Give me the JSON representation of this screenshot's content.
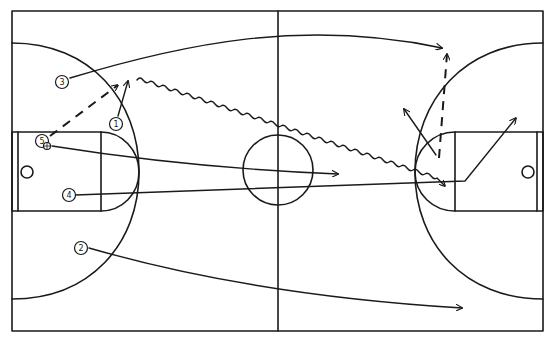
{
  "diagram": {
    "type": "basketball-play-diagram",
    "colors": {
      "line": "#1a1a1a",
      "background": "#ffffff"
    },
    "players": [
      {
        "id": "1",
        "label": "1",
        "x": 116,
        "y": 124
      },
      {
        "id": "2",
        "label": "2",
        "x": 81,
        "y": 248
      },
      {
        "id": "3",
        "label": "3",
        "x": 62,
        "y": 82
      },
      {
        "id": "4",
        "label": "4",
        "x": 69,
        "y": 195
      },
      {
        "id": "5",
        "label": "5",
        "x": 42,
        "y": 141
      }
    ],
    "ball": {
      "holder": "5",
      "x": 47,
      "y": 145
    },
    "actions": [
      {
        "id": "cut-3",
        "kind": "cut",
        "from": "3",
        "description": "Player 3 cuts across court to right wing"
      },
      {
        "id": "cut-1",
        "kind": "cut",
        "from": "1",
        "description": "Player 1 short cut up"
      },
      {
        "id": "pass-5-1",
        "kind": "pass",
        "from": "5",
        "to": "1",
        "description": "Dashed pass from 5 toward 1"
      },
      {
        "id": "dribble-1",
        "kind": "dribble",
        "from": "1",
        "description": "Player 1 dribbles to right elbow"
      },
      {
        "id": "cut-5",
        "kind": "cut",
        "from": "5",
        "description": "Player 5 runs to center court"
      },
      {
        "id": "cut-4",
        "kind": "cut",
        "from": "4",
        "description": "Player 4 runs to right lane then up"
      },
      {
        "id": "cut-2",
        "kind": "cut",
        "from": "2",
        "description": "Player 2 runs to right corner"
      },
      {
        "id": "pass-right",
        "kind": "pass",
        "description": "Dashed pass from right elbow to right wing"
      },
      {
        "id": "option-right",
        "kind": "cut",
        "description": "Option arrow from elbow toward top"
      }
    ]
  }
}
